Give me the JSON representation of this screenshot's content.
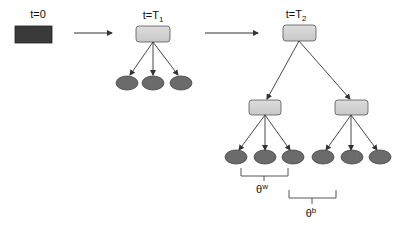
{
  "diagram": {
    "stages": [
      {
        "label_main": "t=0",
        "label_sub": ""
      },
      {
        "label_main": "t=T",
        "label_sub": "1"
      },
      {
        "label_main": "t=T",
        "label_sub": "2"
      }
    ],
    "brackets": [
      {
        "symbol": "θ",
        "superscript": "w"
      },
      {
        "symbol": "θ",
        "superscript": "b"
      }
    ],
    "colors": {
      "initial_node": "#3a3a3a",
      "parent_node": "#d6d6d6",
      "leaf_node": "#6b6b6b",
      "edge": "#333333"
    }
  }
}
